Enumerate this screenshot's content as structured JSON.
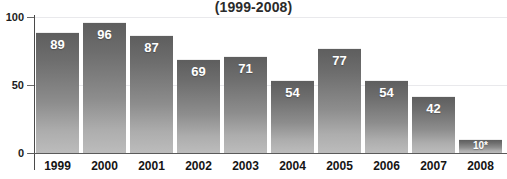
{
  "chart_data": {
    "type": "bar",
    "title": "(1999-2008)",
    "xlabel": "",
    "ylabel": "",
    "categories": [
      "1999",
      "2000",
      "2001",
      "2002",
      "2003",
      "2004",
      "2005",
      "2006",
      "2007",
      "2008"
    ],
    "values": [
      89,
      96,
      87,
      69,
      71,
      54,
      77,
      54,
      42,
      10
    ],
    "data_labels": [
      "89",
      "96",
      "87",
      "69",
      "71",
      "54",
      "77",
      "54",
      "42",
      "10*"
    ],
    "ylim": [
      0,
      100
    ],
    "ytick_labels": [
      "100",
      "50",
      "0"
    ],
    "ytick_values": [
      100,
      50,
      0
    ],
    "grid": true,
    "legend": false,
    "legend_position": "none",
    "annotations": [
      "* asterisk on 2008 value"
    ],
    "colors": {
      "bar_top": "#5e5e5e",
      "bar_bottom": "#bcbcbc",
      "axis": "#4a4a4a",
      "gridline": "#e9e9ec",
      "label_text": "#151515",
      "value_text": "#ffffff",
      "background": "#ffffff"
    }
  }
}
